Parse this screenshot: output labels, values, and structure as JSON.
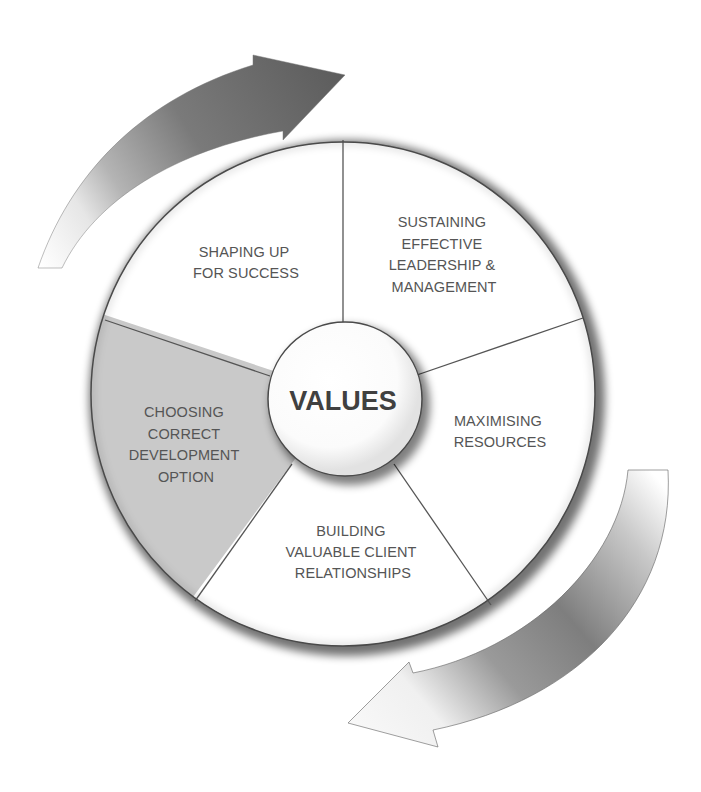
{
  "diagram": {
    "type": "cycle-wheel",
    "colors": {
      "background": "#ffffff",
      "segment_fill": "#ffffff",
      "highlight_segment_fill": "#c9c9c9",
      "outline": "#555555",
      "text": "#555555",
      "hub_text": "#404040",
      "arrow_dark": "#5a5a5a",
      "arrow_light": "#f2f2f2"
    },
    "hub": {
      "label": "VALUES"
    },
    "segments": [
      {
        "id": "shaping",
        "lines": [
          "SHAPING UP",
          "FOR SUCCESS"
        ],
        "highlighted": false
      },
      {
        "id": "sustaining",
        "lines": [
          "SUSTAINING",
          "EFFECTIVE",
          "LEADERSHIP &",
          "MANAGEMENT"
        ],
        "highlighted": false
      },
      {
        "id": "maximising",
        "lines": [
          "MAXIMISING",
          "RESOURCES"
        ],
        "highlighted": false
      },
      {
        "id": "building",
        "lines": [
          "BUILDING",
          "VALUABLE CLIENT",
          "RELATIONSHIPS"
        ],
        "highlighted": false
      },
      {
        "id": "choosing",
        "lines": [
          "CHOOSING",
          "CORRECT",
          "DEVELOPMENT",
          "OPTION"
        ],
        "highlighted": true
      }
    ],
    "arrows": [
      {
        "id": "top-arrow",
        "direction": "clockwise",
        "position": "upper-left"
      },
      {
        "id": "bottom-arrow",
        "direction": "clockwise",
        "position": "lower-right"
      }
    ]
  }
}
